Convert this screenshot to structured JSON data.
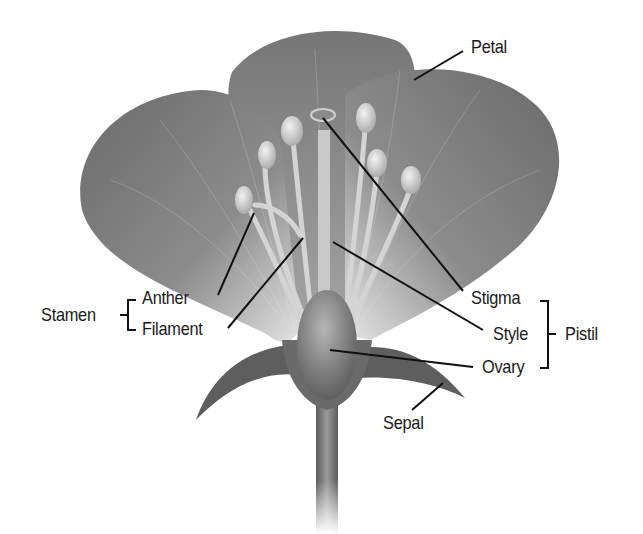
{
  "diagram": {
    "colors": {
      "background": "#ffffff",
      "petal_dark": "#6e6e6e",
      "petal_mid": "#8a8a8a",
      "petal_light": "#d8d8d8",
      "stamen": "#cfcfcf",
      "sepal": "#5a5a5a",
      "ovary": "#7a7a7a",
      "leader_line": "#111111",
      "text": "#1a1a1a"
    },
    "labels": {
      "petal": "Petal",
      "stigma": "Stigma",
      "style": "Style",
      "ovary": "Ovary",
      "pistil": "Pistil",
      "anther": "Anther",
      "filament": "Filament",
      "stamen": "Stamen",
      "sepal": "Sepal"
    },
    "groups": [
      {
        "name": "Stamen",
        "members": [
          "Anther",
          "Filament"
        ]
      },
      {
        "name": "Pistil",
        "members": [
          "Stigma",
          "Style",
          "Ovary"
        ]
      }
    ]
  }
}
